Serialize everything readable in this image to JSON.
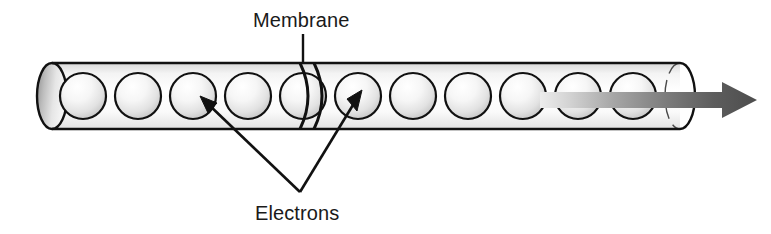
{
  "diagram": {
    "labels": {
      "membrane": "Membrane",
      "electrons": "Electrons"
    },
    "colors": {
      "outline": "#111111",
      "text": "#1a1a1a",
      "tube_fill_light": "#fdfdfd",
      "tube_fill_shade": "#cfcfcf",
      "sphere_highlight": "#ffffff",
      "sphere_shade": "#b8b8b8",
      "cap_dark": "#8f8f8f",
      "arrow_dark": "#4a4a4a",
      "arrow_light": "#e8e8e8",
      "background": "#ffffff"
    },
    "tube": {
      "left_x": 52,
      "right_x": 680,
      "top_y": 63,
      "bottom_y": 129,
      "cap_rx": 15,
      "cap_ry": 33
    },
    "membrane": {
      "x_positions": [
        303,
        315
      ],
      "leader_line": {
        "x": 303,
        "y_top": 33,
        "y_bottom": 63
      }
    },
    "electrons": {
      "count": 11,
      "radius": 23,
      "x_positions": [
        83,
        138,
        193,
        248,
        303,
        358,
        413,
        468,
        523,
        578,
        633
      ],
      "center_y": 96,
      "pointer_vertex": {
        "x": 300,
        "y": 192
      },
      "pointer_targets": [
        {
          "x": 203,
          "y": 100
        },
        {
          "x": 352,
          "y": 96
        }
      ]
    },
    "flow_arrow": {
      "start_x": 540,
      "tip_x": 757,
      "y": 100,
      "shaft_half_height": 8,
      "head_width": 32,
      "head_half_height": 18,
      "direction": "right"
    }
  }
}
